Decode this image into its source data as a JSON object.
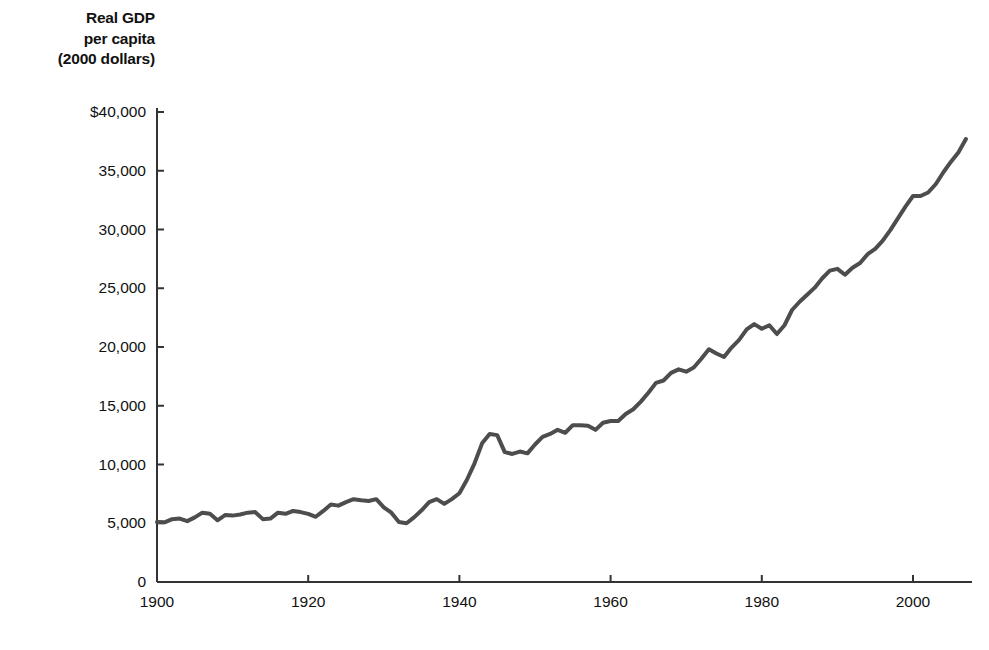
{
  "chart_data": {
    "type": "line",
    "title": "",
    "ylabel_lines": [
      "Real GDP",
      "per capita",
      "(2000 dollars)"
    ],
    "xlabel": "",
    "ylabel": "Real GDP per capita (2000 dollars)",
    "xlim": [
      1900,
      2008
    ],
    "ylim": [
      0,
      40000
    ],
    "grid": false,
    "legend": "none",
    "line_color": "#4d4d4d",
    "line_width": 4,
    "y_ticks": [
      0,
      5000,
      10000,
      15000,
      20000,
      25000,
      30000,
      35000,
      40000
    ],
    "y_tick_labels": [
      "0",
      "5,000",
      "10,000",
      "15,000",
      "20,000",
      "25,000",
      "30,000",
      "35,000",
      "$40,000"
    ],
    "x_ticks": [
      1900,
      1920,
      1940,
      1960,
      1980,
      2000
    ],
    "x_tick_labels": [
      "1900",
      "1920",
      "1940",
      "1960",
      "1980",
      "2000"
    ],
    "series": [
      {
        "name": "Real GDP per capita",
        "x": [
          1900,
          1901,
          1902,
          1903,
          1904,
          1905,
          1906,
          1907,
          1908,
          1909,
          1910,
          1911,
          1912,
          1913,
          1914,
          1915,
          1916,
          1917,
          1918,
          1919,
          1920,
          1921,
          1922,
          1923,
          1924,
          1925,
          1926,
          1927,
          1928,
          1929,
          1930,
          1931,
          1932,
          1933,
          1934,
          1935,
          1936,
          1937,
          1938,
          1939,
          1940,
          1941,
          1942,
          1943,
          1944,
          1945,
          1946,
          1947,
          1948,
          1949,
          1950,
          1951,
          1952,
          1953,
          1954,
          1955,
          1956,
          1957,
          1958,
          1959,
          1960,
          1961,
          1962,
          1963,
          1964,
          1965,
          1966,
          1967,
          1968,
          1969,
          1970,
          1971,
          1972,
          1973,
          1974,
          1975,
          1976,
          1977,
          1978,
          1979,
          1980,
          1981,
          1982,
          1983,
          1984,
          1985,
          1986,
          1987,
          1988,
          1989,
          1990,
          1991,
          1992,
          1993,
          1994,
          1995,
          1996,
          1997,
          1998,
          1999,
          2000,
          2001,
          2002,
          2003,
          2004,
          2005,
          2006,
          2007
        ],
        "values": [
          5100,
          5080,
          5350,
          5400,
          5180,
          5500,
          5900,
          5800,
          5250,
          5700,
          5650,
          5750,
          5900,
          5950,
          5350,
          5400,
          5900,
          5800,
          6050,
          5950,
          5800,
          5550,
          6050,
          6600,
          6500,
          6800,
          7050,
          6950,
          6900,
          7050,
          6350,
          5900,
          5100,
          5000,
          5500,
          6100,
          6800,
          7050,
          6650,
          7050,
          7550,
          8700,
          10100,
          11800,
          12600,
          12500,
          11050,
          10900,
          11100,
          10950,
          11700,
          12350,
          12600,
          12950,
          12700,
          13350,
          13350,
          13300,
          12950,
          13550,
          13700,
          13700,
          14300,
          14700,
          15350,
          16100,
          16950,
          17150,
          17800,
          18100,
          17900,
          18250,
          19000,
          19800,
          19450,
          19150,
          19950,
          20600,
          21500,
          21950,
          21550,
          21850,
          21100,
          21850,
          23150,
          23850,
          24450,
          25050,
          25850,
          26500,
          26650,
          26150,
          26750,
          27150,
          27900,
          28350,
          29050,
          29950,
          30950,
          31950,
          32850,
          32850,
          33150,
          33850,
          34850,
          35750,
          36550,
          37700
        ]
      }
    ],
    "annotations": []
  },
  "axis": {
    "axis_color": "#333333",
    "tick_length": 7
  }
}
